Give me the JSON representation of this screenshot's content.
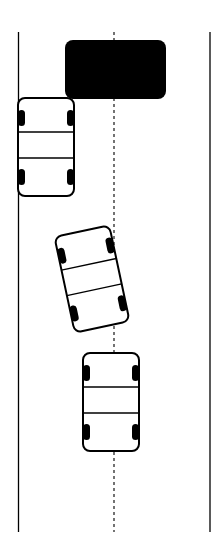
{
  "diagram": {
    "type": "road-scene-top-down",
    "road": {
      "left_edge_x": 18,
      "right_edge_x": 210,
      "center_line_x": 114,
      "top_y": 32,
      "bottom_y": 532,
      "center_line_style": "dashed"
    },
    "obstacle": {
      "label": "",
      "x": 65,
      "y": 40,
      "width": 101,
      "height": 59,
      "color": "#000000"
    },
    "cars": [
      {
        "name": "car-parked-left",
        "cx": 46,
        "cy": 147,
        "width": 56,
        "height": 98,
        "rotation": 0
      },
      {
        "name": "car-turning",
        "cx": 92,
        "cy": 279,
        "width": 56,
        "height": 98,
        "rotation": -12
      },
      {
        "name": "car-center-lane",
        "cx": 111,
        "cy": 402,
        "width": 58,
        "height": 99,
        "rotation": 0
      }
    ],
    "colors": {
      "stroke": "#000000",
      "fill": "#ffffff",
      "background": "#ffffff"
    }
  }
}
